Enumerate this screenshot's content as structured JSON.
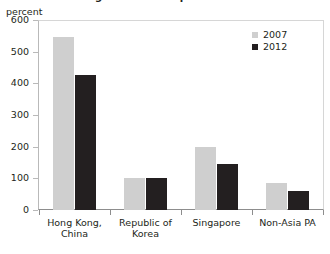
{
  "chart_data": {
    "type": "bar",
    "title": "Figure: Relative price levels",
    "ylabel": "percent",
    "xlabel": "",
    "ylim": [
      0,
      600
    ],
    "yticks": [
      0,
      100,
      200,
      300,
      400,
      500,
      600
    ],
    "ytick_labels": [
      "0",
      "100",
      "200",
      "300",
      "400",
      "500",
      "600"
    ],
    "grid": false,
    "legend_position": "top-right",
    "categories": [
      "Hong Kong, China",
      "Republic of Korea",
      "Singapore",
      "Non-Asia PA"
    ],
    "series": [
      {
        "name": "2007",
        "color": "#cfcfcf",
        "values": [
          545,
          100,
          200,
          85
        ]
      },
      {
        "name": "2012",
        "color": "#231f20",
        "values": [
          425,
          100,
          145,
          60
        ]
      }
    ]
  },
  "axis": {
    "unit_label": "percent"
  },
  "legend": {
    "items": [
      {
        "label": "2007"
      },
      {
        "label": "2012"
      }
    ]
  }
}
